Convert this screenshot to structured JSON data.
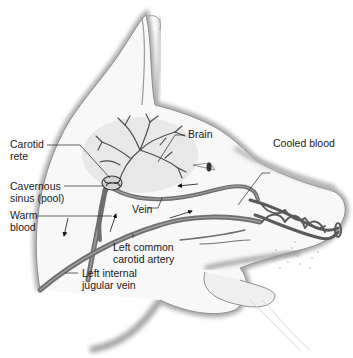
{
  "figure": {
    "labels": {
      "brain": "Brain",
      "carotid_rete": [
        "Carotid",
        "rete"
      ],
      "cooled_blood": "Cooled blood",
      "cavernous_sinus": [
        "Cavernous",
        "sinus (pool)"
      ],
      "vein": "Vein",
      "warm_blood": [
        "Warm",
        "blood"
      ],
      "left_common_carotid_artery": [
        "Left common",
        "carotid artery"
      ],
      "left_internal_jugular_vein": [
        "Left internal",
        "jugular vein"
      ]
    },
    "colors": {
      "outline_shadow": "#9a9a9a",
      "head_fill": "#f7f7f7",
      "brain_fill": "#e6e6e6",
      "vessel": "#6e6e6e",
      "vessel_dark": "#4a4a4a",
      "leader_line": "#222222",
      "text": "#1a1a1a"
    }
  }
}
